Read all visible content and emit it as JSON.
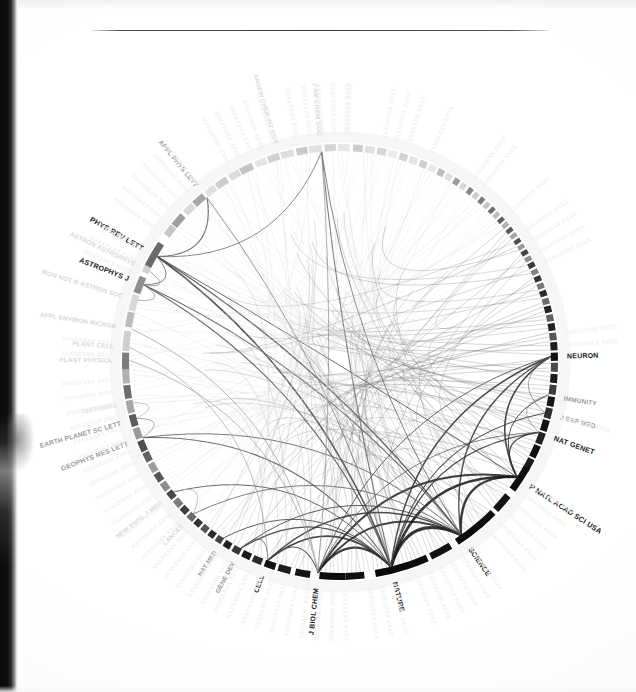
{
  "page": {
    "type": "scanned-figure-page",
    "background_color": "#ffffff",
    "has_top_rule": true,
    "scan_artifact_edge": "left"
  },
  "chart_data": {
    "type": "chord",
    "title": "",
    "subtitle": "",
    "xlabel": "",
    "ylabel": "",
    "legend_position": "none",
    "grid": false,
    "geometry": {
      "center_x": 340,
      "center_y": 362,
      "outer_radius": 218,
      "ring_thickness": 7,
      "start_angle_deg": -90
    },
    "palette": {
      "ring_dark": "#111111",
      "ring_mid": "#6f6f6f",
      "ring_light": "#c9c9c9",
      "ring_faint": "#e3e3e3",
      "chord_dark": "#1a1a1a",
      "chord_mid": "#8a8a8a",
      "chord_light": "#d6d6d6",
      "label_dark": "#1b1b1b",
      "label_mid": "#9a9a9a",
      "label_faint": "#d8d8d8",
      "rule_color": "#3c3c44"
    },
    "labeled_nodes": [
      {
        "label": "PHYS REV LETT",
        "angle": 210.0,
        "weight": 0.06,
        "tone": "dark",
        "font_size": 7.4
      },
      {
        "label": "APPL PHYS LETT",
        "angle": 231.0,
        "weight": 0.028,
        "tone": "mid",
        "font_size": 6.6
      },
      {
        "label": "ANGEW CHEM INT EDIT",
        "angle": 253.5,
        "weight": 0.02,
        "tone": "faint",
        "font_size": 6.0
      },
      {
        "label": "J AM CHEM SOC",
        "angle": 265.0,
        "weight": 0.03,
        "tone": "faint",
        "font_size": 6.4
      },
      {
        "label": "NEURON",
        "angle": 358.5,
        "weight": 0.03,
        "tone": "dark",
        "font_size": 7.0
      },
      {
        "label": "IMMUNITY",
        "angle": 9.0,
        "weight": 0.018,
        "tone": "mid",
        "font_size": 6.4
      },
      {
        "label": "J EXP MED",
        "angle": 14.0,
        "weight": 0.02,
        "tone": "mid",
        "font_size": 6.6
      },
      {
        "label": "NAT GENET",
        "angle": 19.5,
        "weight": 0.026,
        "tone": "dark",
        "font_size": 7.2
      },
      {
        "label": "P NATL ACAD SCI USA",
        "angle": 33.0,
        "weight": 0.075,
        "tone": "dark",
        "font_size": 7.4
      },
      {
        "label": "SCIENCE",
        "angle": 55.0,
        "weight": 0.085,
        "tone": "dark",
        "font_size": 7.2
      },
      {
        "label": "NATURE",
        "angle": 76.0,
        "weight": 0.09,
        "tone": "dark",
        "font_size": 7.2
      },
      {
        "label": "J BIOL CHEM",
        "angle": 96.0,
        "weight": 0.07,
        "tone": "dark",
        "font_size": 7.0
      },
      {
        "label": "CELL",
        "angle": 110.0,
        "weight": 0.034,
        "tone": "dark",
        "font_size": 6.8
      },
      {
        "label": "GENE DEV",
        "angle": 118.0,
        "weight": 0.022,
        "tone": "mid",
        "font_size": 6.4
      },
      {
        "label": "NAT MED",
        "angle": 123.5,
        "weight": 0.018,
        "tone": "mid",
        "font_size": 6.2
      },
      {
        "label": "LANCET",
        "angle": 134.0,
        "weight": 0.02,
        "tone": "faint",
        "font_size": 6.2
      },
      {
        "label": "NEW ENGL J MED",
        "angle": 142.0,
        "weight": 0.024,
        "tone": "faint",
        "font_size": 6.2
      },
      {
        "label": "GEOPHYS RES LETT",
        "angle": 159.0,
        "weight": 0.026,
        "tone": "mid",
        "font_size": 6.8
      },
      {
        "label": "EARTH PLANET SC LETT",
        "angle": 164.5,
        "weight": 0.02,
        "tone": "mid",
        "font_size": 6.6
      },
      {
        "label": "TECTONICS",
        "angle": 169.0,
        "weight": 0.012,
        "tone": "faint",
        "font_size": 6.0
      },
      {
        "label": "PLANT PHYSIOL",
        "angle": 180.5,
        "weight": 0.018,
        "tone": "faint",
        "font_size": 6.4
      },
      {
        "label": "PLANT CELL",
        "angle": 184.0,
        "weight": 0.016,
        "tone": "faint",
        "font_size": 6.4
      },
      {
        "label": "APPL ENVIRON MICROB",
        "angle": 189.0,
        "weight": 0.016,
        "tone": "faint",
        "font_size": 6.2
      },
      {
        "label": "MON NOT R ASTRON SOC",
        "angle": 197.0,
        "weight": 0.026,
        "tone": "faint",
        "font_size": 6.4
      },
      {
        "label": "ASTROPHYS J",
        "angle": 201.5,
        "weight": 0.04,
        "tone": "dark",
        "font_size": 7.2
      },
      {
        "label": "ASTRON ASTROPHYS",
        "angle": 205.5,
        "weight": 0.026,
        "tone": "faint",
        "font_size": 6.4
      }
    ],
    "ring_segments": [
      {
        "angle": 180.0,
        "span": 5.0,
        "tone": "#7c7c7c"
      },
      {
        "angle": 185.6,
        "span": 5.4,
        "tone": "#cfcfcf"
      },
      {
        "angle": 191.4,
        "span": 4.0,
        "tone": "#bdbdbd"
      },
      {
        "angle": 196.0,
        "span": 4.4,
        "tone": "#d8d8d8"
      },
      {
        "angle": 201.0,
        "span": 4.6,
        "tone": "#8f8f8f"
      },
      {
        "angle": 206.2,
        "span": 3.2,
        "tone": "#d2d2d2"
      },
      {
        "angle": 210.0,
        "span": 7.0,
        "tone": "#6a6a6a"
      },
      {
        "angle": 217.6,
        "span": 3.0,
        "tone": "#c6c6c6"
      },
      {
        "angle": 221.2,
        "span": 3.6,
        "tone": "#9e9e9e"
      },
      {
        "angle": 225.4,
        "span": 3.0,
        "tone": "#d9d9d9"
      },
      {
        "angle": 229.0,
        "span": 3.4,
        "tone": "#a8a8a8"
      },
      {
        "angle": 233.0,
        "span": 3.0,
        "tone": "#e0e0e0"
      },
      {
        "angle": 236.6,
        "span": 3.4,
        "tone": "#cdcdcd"
      },
      {
        "angle": 240.6,
        "span": 3.0,
        "tone": "#dcdcdc"
      },
      {
        "angle": 244.2,
        "span": 3.6,
        "tone": "#c4c4c4"
      },
      {
        "angle": 248.4,
        "span": 3.0,
        "tone": "#e4e4e4"
      },
      {
        "angle": 252.0,
        "span": 3.2,
        "tone": "#d0d0d0"
      },
      {
        "angle": 255.8,
        "span": 3.4,
        "tone": "#dedede"
      },
      {
        "angle": 259.8,
        "span": 3.0,
        "tone": "#cacaca"
      },
      {
        "angle": 263.4,
        "span": 3.4,
        "tone": "#e2e2e2"
      },
      {
        "angle": 267.4,
        "span": 3.0,
        "tone": "#d4d4d4"
      },
      {
        "angle": 271.0,
        "span": 3.2,
        "tone": "#e6e6e6"
      },
      {
        "angle": 274.8,
        "span": 2.6,
        "tone": "#cdcdcd"
      },
      {
        "angle": 278.0,
        "span": 2.6,
        "tone": "#e0e0e0"
      },
      {
        "angle": 281.2,
        "span": 2.4,
        "tone": "#d6d6d6"
      },
      {
        "angle": 284.2,
        "span": 2.4,
        "tone": "#ececec"
      },
      {
        "angle": 287.2,
        "span": 2.2,
        "tone": "#d2d2d2"
      },
      {
        "angle": 290.0,
        "span": 2.2,
        "tone": "#e4e4e4"
      },
      {
        "angle": 292.8,
        "span": 2.0,
        "tone": "#cfcfcf"
      },
      {
        "angle": 295.4,
        "span": 2.0,
        "tone": "#e8e8e8"
      },
      {
        "angle": 298.0,
        "span": 1.8,
        "tone": "#bdbdbd"
      },
      {
        "angle": 300.4,
        "span": 1.8,
        "tone": "#e0e0e0"
      },
      {
        "angle": 302.8,
        "span": 1.6,
        "tone": "#9c9c9c"
      },
      {
        "angle": 305.0,
        "span": 1.6,
        "tone": "#dadada"
      },
      {
        "angle": 307.2,
        "span": 1.4,
        "tone": "#8a8a8a"
      },
      {
        "angle": 309.2,
        "span": 1.4,
        "tone": "#cecece"
      },
      {
        "angle": 311.2,
        "span": 1.3,
        "tone": "#7d7d7d"
      },
      {
        "angle": 313.1,
        "span": 1.3,
        "tone": "#c4c4c4"
      },
      {
        "angle": 315.0,
        "span": 1.2,
        "tone": "#6e6e6e"
      },
      {
        "angle": 316.8,
        "span": 1.2,
        "tone": "#bdbdbd"
      },
      {
        "angle": 318.6,
        "span": 1.2,
        "tone": "#606060"
      },
      {
        "angle": 320.4,
        "span": 1.2,
        "tone": "#b0b0b0"
      },
      {
        "angle": 322.2,
        "span": 1.2,
        "tone": "#585858"
      },
      {
        "angle": 324.0,
        "span": 1.2,
        "tone": "#a4a4a4"
      },
      {
        "angle": 325.8,
        "span": 1.2,
        "tone": "#4e4e4e"
      },
      {
        "angle": 327.6,
        "span": 1.2,
        "tone": "#989898"
      },
      {
        "angle": 329.4,
        "span": 1.3,
        "tone": "#444444"
      },
      {
        "angle": 331.3,
        "span": 1.3,
        "tone": "#8d8d8d"
      },
      {
        "angle": 333.2,
        "span": 1.4,
        "tone": "#3b3b3b"
      },
      {
        "angle": 335.2,
        "span": 1.4,
        "tone": "#828282"
      },
      {
        "angle": 337.2,
        "span": 1.5,
        "tone": "#343434"
      },
      {
        "angle": 339.3,
        "span": 1.5,
        "tone": "#777777"
      },
      {
        "angle": 341.4,
        "span": 1.6,
        "tone": "#2c2c2c"
      },
      {
        "angle": 343.6,
        "span": 1.6,
        "tone": "#6c6c6c"
      },
      {
        "angle": 345.8,
        "span": 1.8,
        "tone": "#262626"
      },
      {
        "angle": 348.2,
        "span": 1.8,
        "tone": "#626262"
      },
      {
        "angle": 350.6,
        "span": 2.0,
        "tone": "#202020"
      },
      {
        "angle": 353.2,
        "span": 2.0,
        "tone": "#585858"
      },
      {
        "angle": 355.8,
        "span": 2.2,
        "tone": "#1c1c1c"
      },
      {
        "angle": 358.6,
        "span": 2.2,
        "tone": "#111111"
      },
      {
        "angle": 1.4,
        "span": 2.4,
        "tone": "#4a4a4a"
      },
      {
        "angle": 4.4,
        "span": 2.4,
        "tone": "#1a1a1a"
      },
      {
        "angle": 7.4,
        "span": 2.6,
        "tone": "#3c3c3c"
      },
      {
        "angle": 10.6,
        "span": 2.6,
        "tone": "#161616"
      },
      {
        "angle": 13.8,
        "span": 2.8,
        "tone": "#2e2e2e"
      },
      {
        "angle": 17.2,
        "span": 3.0,
        "tone": "#121212"
      },
      {
        "angle": 20.8,
        "span": 3.2,
        "tone": "#242424"
      },
      {
        "angle": 24.6,
        "span": 3.4,
        "tone": "#101010"
      },
      {
        "angle": 28.6,
        "span": 3.6,
        "tone": "#1a1a1a"
      },
      {
        "angle": 33.0,
        "span": 7.0,
        "tone": "#0d0d0d"
      },
      {
        "angle": 41.0,
        "span": 5.0,
        "tone": "#141414"
      },
      {
        "angle": 47.0,
        "span": 5.0,
        "tone": "#0f0f0f"
      },
      {
        "angle": 53.0,
        "span": 8.0,
        "tone": "#0b0b0b"
      },
      {
        "angle": 62.0,
        "span": 6.0,
        "tone": "#121212"
      },
      {
        "angle": 69.0,
        "span": 6.0,
        "tone": "#0d0d0d"
      },
      {
        "angle": 76.0,
        "span": 9.0,
        "tone": "#090909"
      },
      {
        "angle": 86.0,
        "span": 5.0,
        "tone": "#101010"
      },
      {
        "angle": 92.0,
        "span": 7.0,
        "tone": "#0c0c0c"
      },
      {
        "angle": 100.0,
        "span": 4.0,
        "tone": "#151515"
      },
      {
        "angle": 105.0,
        "span": 3.4,
        "tone": "#1d1d1d"
      },
      {
        "angle": 109.0,
        "span": 3.0,
        "tone": "#131313"
      },
      {
        "angle": 112.6,
        "span": 2.6,
        "tone": "#2a2a2a"
      },
      {
        "angle": 115.8,
        "span": 2.4,
        "tone": "#1a1a1a"
      },
      {
        "angle": 118.8,
        "span": 2.2,
        "tone": "#363636"
      },
      {
        "angle": 121.6,
        "span": 2.0,
        "tone": "#222222"
      },
      {
        "angle": 124.2,
        "span": 1.8,
        "tone": "#444444"
      },
      {
        "angle": 126.6,
        "span": 1.8,
        "tone": "#2b2b2b"
      },
      {
        "angle": 129.0,
        "span": 1.8,
        "tone": "#555555"
      },
      {
        "angle": 131.4,
        "span": 1.8,
        "tone": "#343434"
      },
      {
        "angle": 133.8,
        "span": 2.0,
        "tone": "#6a6a6a"
      },
      {
        "angle": 136.4,
        "span": 2.0,
        "tone": "#3e3e3e"
      },
      {
        "angle": 139.0,
        "span": 2.2,
        "tone": "#7d7d7d"
      },
      {
        "angle": 141.8,
        "span": 2.2,
        "tone": "#4a4a4a"
      },
      {
        "angle": 144.6,
        "span": 2.4,
        "tone": "#8e8e8e"
      },
      {
        "angle": 147.6,
        "span": 2.4,
        "tone": "#565656"
      },
      {
        "angle": 150.6,
        "span": 2.6,
        "tone": "#9e9e9e"
      },
      {
        "angle": 153.8,
        "span": 2.6,
        "tone": "#636363"
      },
      {
        "angle": 157.0,
        "span": 3.0,
        "tone": "#4f4f4f"
      },
      {
        "angle": 160.6,
        "span": 3.0,
        "tone": "#9a9a9a"
      },
      {
        "angle": 164.2,
        "span": 3.2,
        "tone": "#5c5c5c"
      },
      {
        "angle": 168.0,
        "span": 3.4,
        "tone": "#a6a6a6"
      },
      {
        "angle": 172.0,
        "span": 3.6,
        "tone": "#6d6d6d"
      },
      {
        "angle": 176.2,
        "span": 3.8,
        "tone": "#b2b2b2"
      }
    ],
    "chords": [
      {
        "a": 76.0,
        "b": 55.0,
        "tone": "#0c0c0c",
        "width": 3.2
      },
      {
        "a": 76.0,
        "b": 33.0,
        "tone": "#111111",
        "width": 2.6
      },
      {
        "a": 55.0,
        "b": 33.0,
        "tone": "#141414",
        "width": 2.4
      },
      {
        "a": 76.0,
        "b": 96.0,
        "tone": "#1a1a1a",
        "width": 2.2
      },
      {
        "a": 55.0,
        "b": 96.0,
        "tone": "#202020",
        "width": 1.8
      },
      {
        "a": 33.0,
        "b": 96.0,
        "tone": "#1d1d1d",
        "width": 2.0
      },
      {
        "a": 76.0,
        "b": 110.0,
        "tone": "#232323",
        "width": 1.6
      },
      {
        "a": 55.0,
        "b": 110.0,
        "tone": "#2a2a2a",
        "width": 1.4
      },
      {
        "a": 76.0,
        "b": 358.5,
        "tone": "#262626",
        "width": 1.5
      },
      {
        "a": 55.0,
        "b": 358.5,
        "tone": "#2e2e2e",
        "width": 1.3
      },
      {
        "a": 33.0,
        "b": 358.5,
        "tone": "#222222",
        "width": 1.5
      },
      {
        "a": 76.0,
        "b": 19.5,
        "tone": "#2b2b2b",
        "width": 1.3
      },
      {
        "a": 33.0,
        "b": 19.5,
        "tone": "#272727",
        "width": 1.3
      },
      {
        "a": 76.0,
        "b": 14.0,
        "tone": "#333333",
        "width": 1.1
      },
      {
        "a": 33.0,
        "b": 9.0,
        "tone": "#353535",
        "width": 1.0
      },
      {
        "a": 76.0,
        "b": 118.0,
        "tone": "#303030",
        "width": 1.2
      },
      {
        "a": 55.0,
        "b": 118.0,
        "tone": "#3a3a3a",
        "width": 1.0
      },
      {
        "a": 76.0,
        "b": 123.5,
        "tone": "#3d3d3d",
        "width": 1.0
      },
      {
        "a": 76.0,
        "b": 142.0,
        "tone": "#4a4a4a",
        "width": 1.0
      },
      {
        "a": 55.0,
        "b": 134.0,
        "tone": "#545454",
        "width": 0.9
      },
      {
        "a": 76.0,
        "b": 210.0,
        "tone": "#3c3c3c",
        "width": 1.6
      },
      {
        "a": 55.0,
        "b": 210.0,
        "tone": "#464646",
        "width": 1.4
      },
      {
        "a": 33.0,
        "b": 210.0,
        "tone": "#4e4e4e",
        "width": 1.0
      },
      {
        "a": 76.0,
        "b": 201.5,
        "tone": "#4a4a4a",
        "width": 1.2
      },
      {
        "a": 55.0,
        "b": 201.5,
        "tone": "#555555",
        "width": 1.1
      },
      {
        "a": 76.0,
        "b": 159.0,
        "tone": "#505050",
        "width": 1.1
      },
      {
        "a": 55.0,
        "b": 159.0,
        "tone": "#5b5b5b",
        "width": 1.0
      },
      {
        "a": 76.0,
        "b": 265.0,
        "tone": "#5e5e5e",
        "width": 1.1
      },
      {
        "a": 55.0,
        "b": 265.0,
        "tone": "#686868",
        "width": 1.0
      },
      {
        "a": 76.0,
        "b": 231.0,
        "tone": "#6a6a6a",
        "width": 0.9
      },
      {
        "a": 210.0,
        "b": 231.0,
        "tone": "#5a5a5a",
        "width": 1.2
      },
      {
        "a": 210.0,
        "b": 265.0,
        "tone": "#6f6f6f",
        "width": 1.0
      },
      {
        "a": 210.0,
        "b": 201.5,
        "tone": "#636363",
        "width": 1.0
      },
      {
        "a": 201.5,
        "b": 205.5,
        "tone": "#8a8a8a",
        "width": 0.9
      },
      {
        "a": 201.5,
        "b": 197.0,
        "tone": "#8f8f8f",
        "width": 0.9
      },
      {
        "a": 159.0,
        "b": 164.5,
        "tone": "#8c8c8c",
        "width": 0.9
      },
      {
        "a": 96.0,
        "b": 110.0,
        "tone": "#3f3f3f",
        "width": 1.2
      },
      {
        "a": 96.0,
        "b": 358.5,
        "tone": "#4d4d4d",
        "width": 1.0
      },
      {
        "a": 96.0,
        "b": 19.5,
        "tone": "#585858",
        "width": 0.9
      },
      {
        "a": 110.0,
        "b": 118.0,
        "tone": "#5c5c5c",
        "width": 0.9
      },
      {
        "a": 96.0,
        "b": 265.0,
        "tone": "#8d8d8d",
        "width": 0.9
      },
      {
        "a": 96.0,
        "b": 189.0,
        "tone": "#909090",
        "width": 0.8
      },
      {
        "a": 96.0,
        "b": 180.5,
        "tone": "#979797",
        "width": 0.8
      },
      {
        "a": 110.0,
        "b": 184.0,
        "tone": "#9d9d9d",
        "width": 0.8
      },
      {
        "a": 358.5,
        "b": 14.0,
        "tone": "#7a7a7a",
        "width": 0.8
      },
      {
        "a": 19.5,
        "b": 9.0,
        "tone": "#858585",
        "width": 0.8
      },
      {
        "a": 142.0,
        "b": 134.0,
        "tone": "#a6a6a6",
        "width": 0.8
      },
      {
        "a": 164.5,
        "b": 169.0,
        "tone": "#adadad",
        "width": 0.8
      }
    ],
    "summary": {
      "node_count_labeled": 26,
      "ring_segment_count": 103,
      "chord_count": 47,
      "hub_nodes": [
        "NATURE",
        "SCIENCE",
        "P NATL ACAD SCI USA",
        "J BIOL CHEM",
        "PHYS REV LETT"
      ]
    }
  }
}
